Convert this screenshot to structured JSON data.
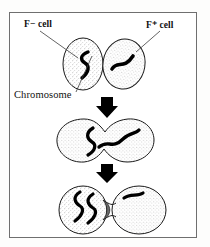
{
  "figure": {
    "name": "bacterial-conjugation-diagram",
    "border_color": "#6f6f6f",
    "background": "#ffffff",
    "ink_color": "#000000",
    "stipple_color": "#8a8a8a"
  },
  "labels": {
    "f_minus_cell": "F− cell",
    "f_plus_cell": "F⁺ cell",
    "chromosome": "Chromosome"
  },
  "stages": [
    {
      "id": "stage-1-contact",
      "description": "F minus cell and F plus cell in contact",
      "cells": [
        {
          "role": "f-minus",
          "chromosome_shape": "s-curve"
        },
        {
          "role": "f-plus",
          "chromosome_shape": "wave"
        }
      ]
    },
    {
      "id": "stage-2-fusion",
      "description": "Cells fused forming conjugation bridge",
      "cells": [
        {
          "role": "f-minus",
          "chromosome_shape": "s-curve"
        },
        {
          "role": "f-plus",
          "chromosome_shape": "wave"
        }
      ]
    },
    {
      "id": "stage-3-transfer",
      "description": "DNA transferred through bridge into recipient cell",
      "cells": [
        {
          "role": "f-minus",
          "chromosome_shape": "double-s-curve"
        },
        {
          "role": "f-plus",
          "chromosome_shape": "short-wave"
        }
      ]
    }
  ],
  "arrows": [
    {
      "id": "arrow-stage1-to-stage2",
      "direction": "down",
      "color": "#000000"
    },
    {
      "id": "arrow-stage2-to-stage3",
      "direction": "down",
      "color": "#000000"
    }
  ]
}
